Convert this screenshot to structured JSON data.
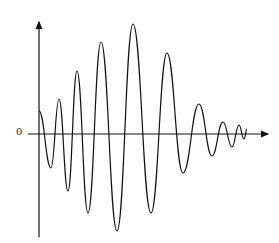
{
  "diagram": {
    "type": "waveform",
    "y_axis_label": "0",
    "stroke_color": "#111111",
    "axes": {
      "origin": [
        39,
        134
      ],
      "y_axis_top": [
        39,
        20
      ],
      "y_axis_bottom": [
        39,
        237
      ],
      "x_axis_left": [
        28,
        134
      ],
      "x_axis_right": [
        270,
        134
      ]
    },
    "wave_points": [
      [
        39,
        111
      ],
      [
        51,
        168
      ],
      [
        59,
        99
      ],
      [
        68,
        191
      ],
      [
        77,
        71
      ],
      [
        88,
        213
      ],
      [
        101,
        42
      ],
      [
        117,
        231
      ],
      [
        133,
        24
      ],
      [
        151,
        213
      ],
      [
        167,
        53
      ],
      [
        183,
        173
      ],
      [
        199,
        104
      ],
      [
        212,
        156
      ],
      [
        223,
        122
      ],
      [
        232,
        147
      ],
      [
        239,
        125
      ],
      [
        244,
        139
      ],
      [
        247,
        129
      ]
    ]
  }
}
